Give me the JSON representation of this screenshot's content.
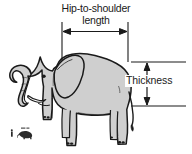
{
  "figure": {
    "background_color": "#ffffff",
    "body_fill_color": "#cfcfcf",
    "outline_color": "#1a1a1a",
    "text_color": "#1a1a1a"
  },
  "annotations": {
    "horizontal_dimension": {
      "label_line_1": "Hip-to-shoulder",
      "label_line_2": "length",
      "orientation": "horizontal",
      "arrow_style": "double-headed"
    },
    "vertical_dimension": {
      "label": "Thickness",
      "orientation": "vertical",
      "arrow_style": "double-headed"
    }
  },
  "subject": {
    "animal": "elephant",
    "view": "side-profile",
    "parts": [
      "trunk",
      "tusk",
      "ear",
      "eye",
      "tail",
      "legs",
      "toenails"
    ]
  },
  "scale_reference": {
    "icon": "person-and-elephant-silhouette",
    "position": "bottom-left"
  }
}
